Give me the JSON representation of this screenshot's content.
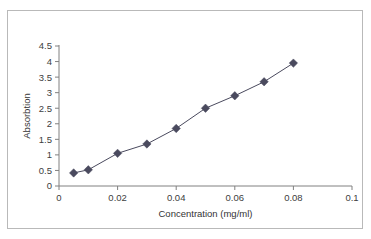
{
  "chart_data": {
    "type": "scatter",
    "title": "",
    "xlabel": "Concentration (mg/ml)",
    "ylabel": "Absorbtion",
    "xlim": [
      0,
      0.1
    ],
    "ylim": [
      0,
      4.5
    ],
    "grid": false,
    "legend": false,
    "marker": "diamond",
    "connected": true,
    "series_color": "#4a4a5e",
    "x": [
      0.005,
      0.01,
      0.02,
      0.03,
      0.04,
      0.05,
      0.06,
      0.07,
      0.08
    ],
    "y": [
      0.42,
      0.52,
      1.05,
      1.35,
      1.85,
      2.5,
      2.9,
      3.35,
      3.95
    ],
    "xticks": [
      0,
      0.02,
      0.04,
      0.06,
      0.08,
      0.1
    ],
    "xticklabels": [
      "0",
      "0.02",
      "0.04",
      "0.06",
      "0.08",
      "0.1"
    ],
    "yticks": [
      0,
      0.5,
      1,
      1.5,
      2,
      2.5,
      3,
      3.5,
      4,
      4.5
    ],
    "yticklabels": [
      "0",
      "0.5",
      "1",
      "1.5",
      "2",
      "2.5",
      "3",
      "3.5",
      "4",
      "4.5"
    ]
  },
  "figure": {
    "border_color": "#b9b9b9",
    "axis_color": "#808080",
    "background": "#ffffff"
  }
}
